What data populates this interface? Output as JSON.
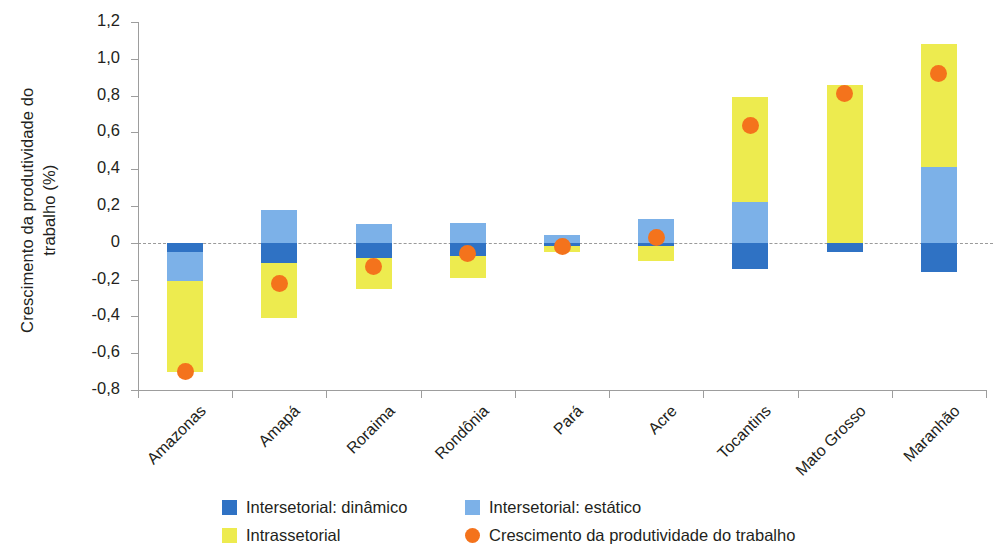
{
  "chart_data": {
    "type": "bar",
    "subtype": "stacked-bar-with-scatter-overlay",
    "title": "",
    "xlabel": "",
    "ylabel": "Crescimento da produtividade do trabalho (%)",
    "ylim": [
      -0.8,
      1.2
    ],
    "ytick_step": 0.2,
    "ytick_labels": [
      "1,2",
      "1,0",
      "0,8",
      "0,6",
      "0,4",
      "0,2",
      "0",
      "-0,2",
      "-0,4",
      "-0,6",
      "-0,8"
    ],
    "ytick_values": [
      1.2,
      1.0,
      0.8,
      0.6,
      0.4,
      0.2,
      0,
      -0.2,
      -0.4,
      -0.6,
      -0.8
    ],
    "grid": false,
    "zero_reference_line": true,
    "legend_position": "bottom",
    "categories": [
      "Amazonas",
      "Amapá",
      "Roraima",
      "Rondônia",
      "Pará",
      "Acre",
      "Tocantins",
      "Mato Grosso",
      "Maranhão"
    ],
    "series": [
      {
        "name": "Intersetorial: dinâmico",
        "color": "#2f72c4",
        "values": [
          -0.05,
          -0.11,
          -0.08,
          -0.07,
          -0.02,
          -0.02,
          -0.14,
          -0.05,
          -0.16
        ]
      },
      {
        "name": "Intersetorial: estático",
        "color": "#7cb1e8",
        "values": [
          -0.16,
          0.18,
          0.1,
          0.11,
          0.04,
          0.13,
          0.22,
          0.0,
          0.41
        ]
      },
      {
        "name": "Intrassetorial",
        "color": "#edeb4f",
        "values": [
          -0.49,
          -0.3,
          -0.17,
          -0.12,
          -0.03,
          -0.08,
          0.57,
          0.86,
          0.67
        ]
      }
    ],
    "overlay": {
      "name": "Crescimento da produtividade do trabalho",
      "color": "#f4731c",
      "marker": "circle",
      "values": [
        -0.7,
        -0.22,
        -0.13,
        -0.06,
        -0.02,
        0.03,
        0.64,
        0.81,
        0.92
      ]
    }
  },
  "axis": {
    "y_title": "Crescimento da produtividade do\\ntrabalho (%)",
    "y_title_line1": "Crescimento da produtividade do",
    "y_title_line2": "trabalho (%)"
  },
  "legend": {
    "items": [
      {
        "label": "Intersetorial: dinâmico",
        "color": "#2f72c4",
        "marker": "square"
      },
      {
        "label": "Intersetorial: estático",
        "color": "#7cb1e8",
        "marker": "square"
      },
      {
        "label": "Intrassetorial",
        "color": "#edeb4f",
        "marker": "square"
      },
      {
        "label": "Crescimento da produtividade do trabalho",
        "color": "#f4731c",
        "marker": "circle"
      }
    ]
  },
  "colors": {
    "intersetorial_dinamico": "#2f72c4",
    "intersetorial_estatico": "#7cb1e8",
    "intrassetorial": "#edeb4f",
    "produtividade": "#f4731c",
    "axis": "#9d9d9d",
    "text": "#231f20",
    "background": "#ffffff"
  }
}
